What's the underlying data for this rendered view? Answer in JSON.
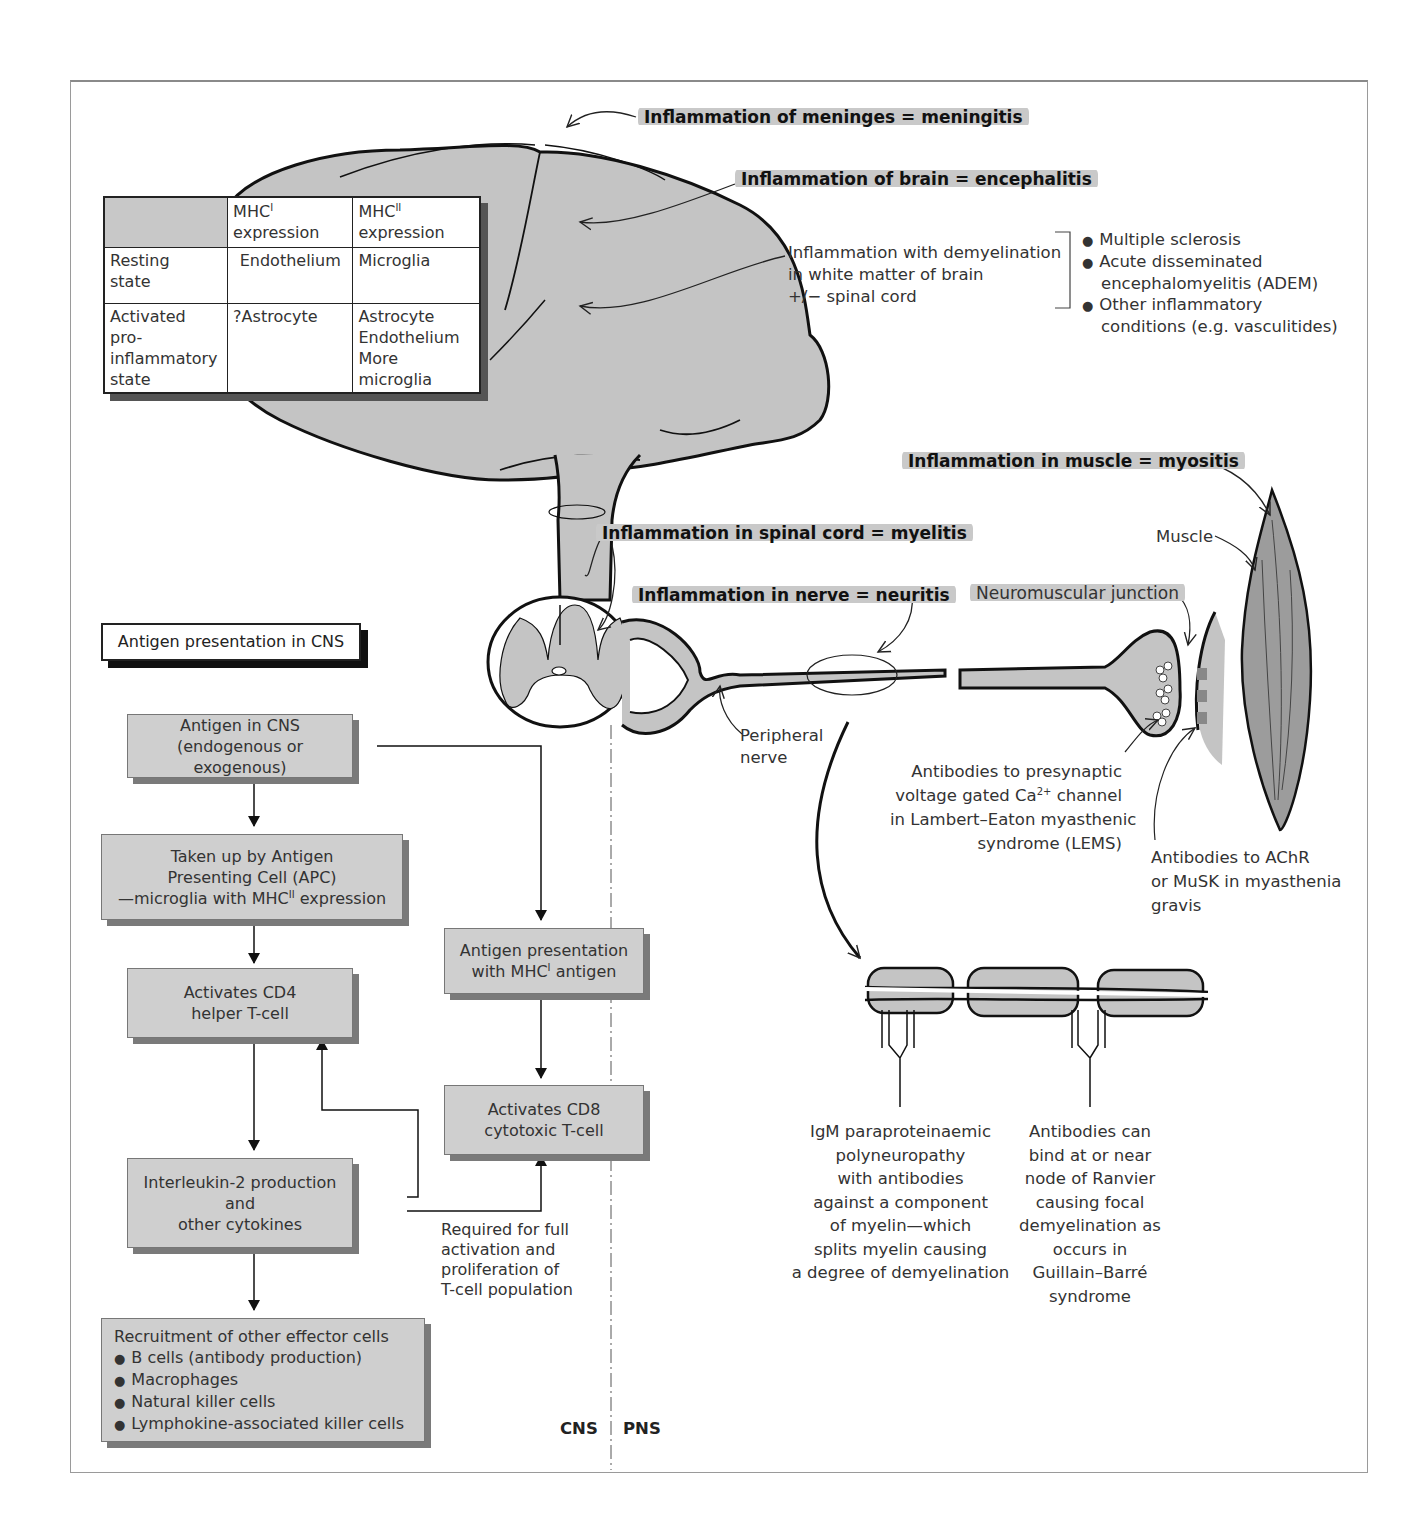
{
  "labels": {
    "meningitis": "Inflammation of meninges = meningitis",
    "encephalitis": "Inflammation of brain = encephalitis",
    "demyelination": [
      "Inflammation with demyelination",
      "in white matter of brain",
      "+/− spinal cord"
    ],
    "demyelination_conditions": [
      "Multiple sclerosis",
      "Acute disseminated",
      "encephalomyelitis (ADEM)",
      "Other inflammatory",
      "conditions (e.g. vasculitides)"
    ],
    "myositis": "Inflammation in muscle = myositis",
    "myelitis": "Inflammation in spinal cord = myelitis",
    "neuritis": "Inflammation in nerve = neuritis",
    "muscle": "Muscle",
    "nmj": "Neuromuscular junction",
    "peripheral_nerve": [
      "Peripheral",
      "nerve"
    ],
    "lems": [
      "Antibodies to presynaptic",
      "voltage gated Ca",
      "2+",
      " channel",
      "in Lambert–Eaton myasthenic",
      "syndrome (LEMS)"
    ],
    "achr": [
      "Antibodies to AChR",
      "or MuSK in myasthenia",
      "gravis"
    ],
    "igm": [
      "IgM paraproteinaemic",
      "polyneuropathy",
      "with antibodies",
      "against a component",
      "of myelin—which",
      "splits myelin causing",
      "a degree of demyelination"
    ],
    "gbs": [
      "Antibodies can",
      "bind at or near",
      "node of Ranvier",
      "causing focal",
      "demyelination as",
      "occurs in",
      "Guillain–Barré",
      "syndrome"
    ],
    "cns": "CNS",
    "pns": "PNS"
  },
  "mhc_table": {
    "header": [
      "",
      "MHC",
      "I",
      " expression",
      "MHC",
      "II",
      " expression"
    ],
    "rows": [
      {
        "state": [
          "Resting",
          "state"
        ],
        "mhc1": "Endothelium",
        "mhc2": [
          "Microglia"
        ]
      },
      {
        "state": [
          "Activated pro-",
          "inflammatory",
          "state"
        ],
        "mhc1": "?Astrocyte",
        "mhc2": [
          "Astrocyte",
          "Endothelium",
          "More microglia"
        ]
      }
    ]
  },
  "flow": {
    "title": "Antigen presentation in CNS",
    "antigen": [
      "Antigen in CNS",
      "(endogenous or exogenous)"
    ],
    "apc": [
      "Taken up by Antigen",
      "Presenting Cell (APC)",
      "—microglia with MHC",
      "II",
      " expression"
    ],
    "mhc1_present": [
      "Antigen presentation",
      "with MHC",
      "I",
      " antigen"
    ],
    "cd4": [
      "Activates CD4",
      "helper T-cell"
    ],
    "cd8": [
      "Activates CD8",
      "cytotoxic T-cell"
    ],
    "il2": [
      "Interleukin-2 production",
      "and",
      "other cytokines"
    ],
    "required": [
      "Required for full",
      "activation and",
      "proliferation of",
      "T-cell population"
    ],
    "recruitment": {
      "title": "Recruitment of other effector cells",
      "items": [
        "B cells (antibody production)",
        "Macrophages",
        "Natural killer cells",
        "Lymphokine-associated killer cells"
      ]
    }
  },
  "colors": {
    "tissue_fill": "#c4c4c4",
    "box_fill": "#cfcfcf",
    "highlight": "#c9c9c9",
    "line": "#111111"
  }
}
